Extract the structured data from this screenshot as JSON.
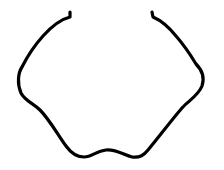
{
  "figure": {
    "background_color": "#ffffff",
    "stroke_color": "#000000",
    "stroke_width": 3.2
  }
}
